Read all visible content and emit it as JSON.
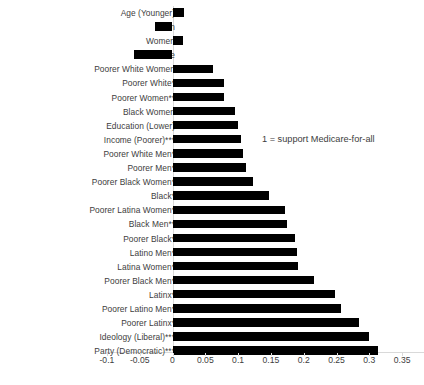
{
  "chart_data": {
    "type": "bar",
    "orientation": "horizontal",
    "title": "",
    "subtitle": "",
    "xlabel": "",
    "ylabel": "",
    "xlim": [
      -0.1,
      0.35
    ],
    "xticks": [
      -0.1,
      -0.05,
      0,
      0.05,
      0.1,
      0.15,
      0.2,
      0.25,
      0.3,
      0.35
    ],
    "xtick_labels": [
      "-0.1",
      "-0.05",
      "0",
      "0.05",
      "0.1",
      "0.15",
      "0.2",
      "0.25",
      "0.3",
      "0.35"
    ],
    "grid": false,
    "legend": null,
    "bar_color": "#000000",
    "axis_color": "#d9d9d9",
    "annotations": [
      {
        "text": "1 = support Medicare-for-all",
        "x": 0.14,
        "y_row": 9
      }
    ],
    "categories": [
      "Age (Younger)",
      "Men",
      "Women",
      "White",
      "Poorer White Women",
      "Poorer White*",
      "Poorer Women**",
      "Black Women",
      "Education (Lower)",
      "Income (Poorer)***",
      "Poorer White Men*",
      "Poorer Men*",
      "Poorer Black Women*",
      "Black*",
      "Poorer Latina Women*",
      "Black Men**",
      "Poorer Black*",
      "Latino Men*",
      "Latina Women*",
      "Poorer Black Men*",
      "Latinx*",
      "Poorer Latino Men*",
      "Poorer Latinx*",
      "Ideology (Liberal)***",
      "Party (Democratic)***"
    ],
    "values": [
      0.018,
      -0.026,
      0.016,
      -0.058,
      0.061,
      0.078,
      0.079,
      0.096,
      0.1,
      0.105,
      0.108,
      0.112,
      0.122,
      0.147,
      0.172,
      0.175,
      0.186,
      0.19,
      0.191,
      0.215,
      0.247,
      0.257,
      0.285,
      0.3,
      0.314
    ]
  }
}
